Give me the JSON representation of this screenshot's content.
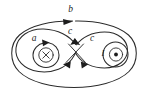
{
  "figure": {
    "kind": "physics-diagram",
    "background_color": "#ffffff",
    "stroke_color": "#2b2b2b",
    "width": 148,
    "height": 97
  },
  "labels": {
    "loop_outer": "b",
    "loop_inner_left": "a",
    "loop_fig8_left": "c",
    "loop_fig8_right": "c",
    "current_right": "I"
  },
  "symbols": {
    "left_wire": "×",
    "right_wire": "⊙",
    "left_wire_meaning": "current into page",
    "right_wire_meaning": "current out of page"
  },
  "loops": [
    {
      "name": "b",
      "label": "b",
      "shape": "outer-ellipse",
      "encloses": [
        "left-wire",
        "right-wire"
      ],
      "direction": "clockwise"
    },
    {
      "name": "a",
      "label": "a",
      "shape": "inner-circle-left",
      "encloses": [
        "left-wire"
      ],
      "direction": "clockwise"
    },
    {
      "name": "c",
      "label": "c",
      "shape": "figure-eight",
      "encloses": [
        "left-wire",
        "right-wire"
      ],
      "direction": "crossing"
    }
  ],
  "wires": [
    {
      "name": "left-wire",
      "symbol": "×",
      "label": "",
      "position": "left"
    },
    {
      "name": "right-wire",
      "symbol": "⊙",
      "label": "I",
      "position": "right"
    }
  ]
}
